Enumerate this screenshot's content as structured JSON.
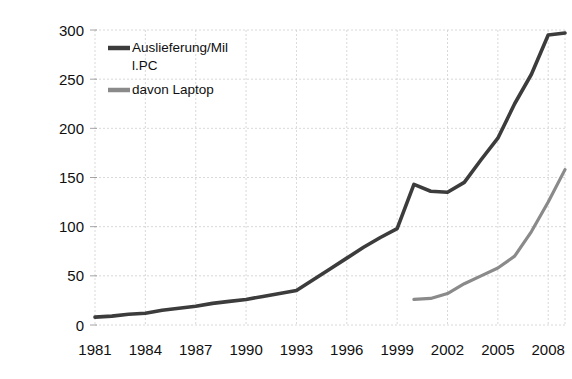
{
  "chart_data": {
    "type": "line",
    "title": "",
    "subtitle": "",
    "xlabel": "",
    "ylabel": "",
    "xlim": [
      1981,
      2009
    ],
    "ylim": [
      0,
      300
    ],
    "grid": true,
    "legend_position": "top-left-inside",
    "x_tick_labels": [
      "1981",
      "1984",
      "1987",
      "1990",
      "1993",
      "1996",
      "1999",
      "2002",
      "2005",
      "2008"
    ],
    "x_tick_values": [
      1981,
      1984,
      1987,
      1990,
      1993,
      1996,
      1999,
      2002,
      2005,
      2008
    ],
    "y_tick_labels": [
      "0",
      "50",
      "100",
      "150",
      "200",
      "250",
      "300"
    ],
    "y_tick_values": [
      0,
      50,
      100,
      150,
      200,
      250,
      300
    ],
    "series": [
      {
        "name": "Auslieferung/Mil l.PC",
        "legend_label_line1": "Auslieferung/Mil",
        "legend_label_line2": "l.PC",
        "color": "#3c3c3c",
        "x": [
          1981,
          1982,
          1983,
          1984,
          1985,
          1986,
          1987,
          1988,
          1989,
          1990,
          1991,
          1992,
          1993,
          1994,
          1995,
          1996,
          1997,
          1998,
          1999,
          2000,
          2001,
          2002,
          2003,
          2004,
          2005,
          2006,
          2007,
          2008,
          2009
        ],
        "values": [
          8,
          9,
          11,
          12,
          15,
          17,
          19,
          22,
          24,
          26,
          29,
          32,
          35,
          46,
          57,
          68,
          79,
          89,
          98,
          143,
          136,
          135,
          145,
          168,
          190,
          225,
          255,
          295,
          297
        ]
      },
      {
        "name": "davon Laptop",
        "legend_label_line1": "davon Laptop",
        "legend_label_line2": "",
        "color": "#8a8a8a",
        "x": [
          2000,
          2001,
          2002,
          2003,
          2004,
          2005,
          2006,
          2007,
          2008,
          2009
        ],
        "values": [
          26,
          27,
          32,
          42,
          50,
          58,
          70,
          95,
          125,
          158
        ]
      }
    ]
  },
  "legend": {
    "entries": [
      {
        "label_line1": "Auslieferung/Mil",
        "label_line2": "l.PC",
        "swatch_color": "#3c3c3c"
      },
      {
        "label_line1": "davon Laptop",
        "label_line2": "",
        "swatch_color": "#8a8a8a"
      }
    ]
  },
  "axes": {
    "y_ticks": [
      "300",
      "250",
      "200",
      "150",
      "100",
      "50",
      "0"
    ],
    "x_ticks": [
      "1981",
      "1984",
      "1987",
      "1990",
      "1993",
      "1996",
      "1999",
      "2002",
      "2005",
      "2008"
    ]
  }
}
